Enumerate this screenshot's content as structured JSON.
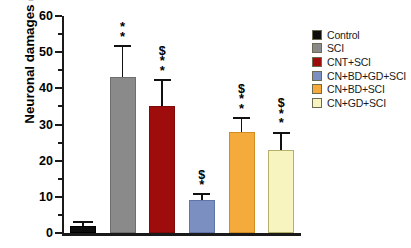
{
  "chart_data": {
    "type": "bar",
    "title": "",
    "xlabel": "",
    "ylabel": "Neuronal damages (Nr)",
    "ylim": [
      0,
      60
    ],
    "ytick_step": 10,
    "ytick_labels": [
      "0",
      "10",
      "20",
      "30",
      "40",
      "50",
      "60"
    ],
    "grid": false,
    "legend_position": "right",
    "categories": [
      "Control",
      "SCI",
      "CNT+SCI",
      "CN+BD+GD+SCI",
      "CN+BD+SCI",
      "CN+GD+SCI"
    ],
    "values": [
      2,
      43,
      35,
      9,
      28,
      23
    ],
    "errors": [
      1.2,
      9,
      7.5,
      2,
      4,
      5
    ],
    "annotations": [
      "",
      "**",
      "$**",
      "$*",
      "$**",
      "$**"
    ],
    "series": [
      {
        "name": "Neuronal damages",
        "values": [
          2,
          43,
          35,
          9,
          28,
          23
        ]
      }
    ],
    "bars": [
      {
        "label": "Control",
        "value": 2,
        "error": 1.2,
        "color": "#0d0d0d",
        "edge": "#000000",
        "annotation": []
      },
      {
        "label": "SCI",
        "value": 43,
        "error": 9,
        "color": "#8a8a8a",
        "edge": "#6e6e6e",
        "annotation": [
          "*",
          "*"
        ]
      },
      {
        "label": "CNT+SCI",
        "value": 35,
        "error": 7.5,
        "color": "#9e0c0c",
        "edge": "#7d0909",
        "annotation": [
          "$",
          "*",
          "*"
        ]
      },
      {
        "label": "CN+BD+GD+SCI",
        "value": 9,
        "error": 2,
        "color": "#7b8fc0",
        "edge": "#5f74a8",
        "annotation": [
          "$",
          "*"
        ]
      },
      {
        "label": "CN+BD+SCI",
        "value": 28,
        "error": 4,
        "color": "#f5ab3c",
        "edge": "#d18c22",
        "annotation": [
          "$",
          "*",
          "*"
        ]
      },
      {
        "label": "CN+GD+SCI",
        "value": 23,
        "error": 5,
        "color": "#f7f4c0",
        "edge": "#b5b06a",
        "annotation": [
          "$",
          "*",
          "*"
        ]
      }
    ]
  },
  "legend": {
    "items": [
      {
        "label": "Control",
        "color": "#0d0d0d"
      },
      {
        "label": "SCI",
        "color": "#8a8a8a"
      },
      {
        "label": "CNT+SCI",
        "color": "#9e0c0c"
      },
      {
        "label": "CN+BD+GD+SCI",
        "color": "#7b8fc0"
      },
      {
        "label": "CN+BD+SCI",
        "color": "#f5ab3c"
      },
      {
        "label": "CN+GD+SCI",
        "color": "#f7f4c0"
      }
    ]
  }
}
